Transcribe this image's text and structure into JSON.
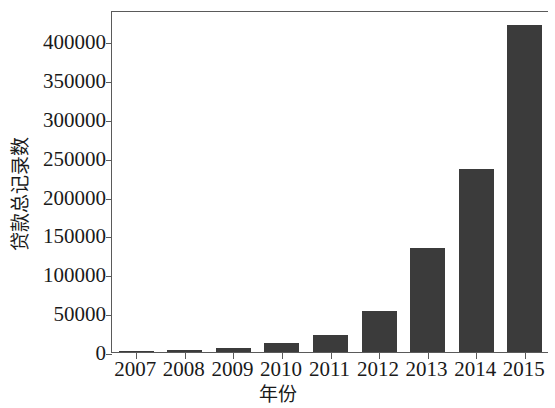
{
  "chart_data": {
    "type": "bar",
    "title": "",
    "subtitle": "",
    "xlabel": "年份",
    "ylabel": "贷款总记录数",
    "categories": [
      "2007",
      "2008",
      "2009",
      "2010",
      "2011",
      "2012",
      "2013",
      "2014",
      "2015"
    ],
    "values": [
      600,
      2400,
      5200,
      12000,
      21500,
      53000,
      134000,
      235600,
      421000
    ],
    "ylim": [
      0,
      440000
    ],
    "xlim": [
      0,
      9
    ],
    "yticks": [
      0,
      50000,
      100000,
      150000,
      200000,
      250000,
      300000,
      350000,
      400000
    ],
    "ytick_labels": [
      "0",
      "50000",
      "100000",
      "150000",
      "200000",
      "250000",
      "300000",
      "350000",
      "400000"
    ],
    "grid": false,
    "legend": null,
    "legend_position": "none",
    "bar_color": "#3b3b3b",
    "axis_color": "#5a5a5a",
    "background": "#ffffff",
    "annotations": []
  },
  "figure": {
    "name": "loan-records-by-year-bar-chart"
  }
}
